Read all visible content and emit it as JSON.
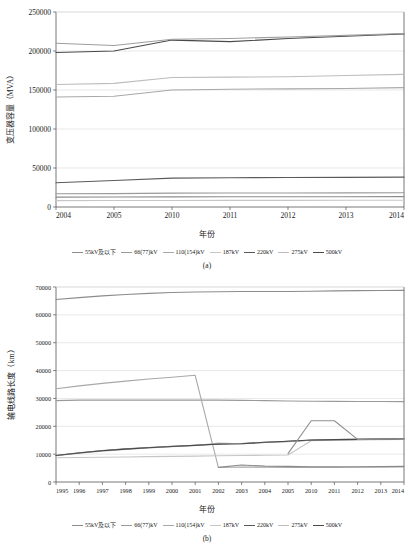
{
  "figure": {
    "panels": [
      {
        "caption": "(a)",
        "xlabel": "年份",
        "ylabel": "变压器容量（MVA）",
        "chart_index": 0
      },
      {
        "caption": "(b)",
        "xlabel": "年份",
        "ylabel": "输电线路长度（km）",
        "chart_index": 1
      }
    ],
    "legend_labels": [
      "55kV及以下",
      "66(77)kV",
      "110(154)kV",
      "187kV",
      "220kV",
      "275kV",
      "500kV"
    ],
    "legend_colors": [
      "#8c8c8c",
      "#9a9a9a",
      "#a8a8a8",
      "#c6c6c6",
      "#5a5a5a",
      "#bdbdbd",
      "#4a4a4a"
    ]
  },
  "chart_data": [
    {
      "type": "line",
      "title": "",
      "subfigure": "(a)",
      "xlabel": "年份",
      "ylabel": "变压器容量（MVA）",
      "categories": [
        "2004",
        "2005",
        "2010",
        "2011",
        "2012",
        "2013",
        "2014"
      ],
      "ylim": [
        0,
        250000
      ],
      "yticks": [
        0,
        50000,
        100000,
        150000,
        200000,
        250000
      ],
      "grid": true,
      "legend_position": "bottom",
      "series": [
        {
          "name": "55kV及以下",
          "color": "#8c8c8c",
          "values": [
            12600,
            12800,
            13000,
            13100,
            13100,
            13200,
            13300
          ]
        },
        {
          "name": "66(77)kV",
          "color": "#9a9a9a",
          "values": [
            17000,
            17200,
            17800,
            17900,
            18000,
            18100,
            18200
          ]
        },
        {
          "name": "110(154)kV",
          "color": "#a8a8a8",
          "values": [
            141000,
            142000,
            150000,
            151000,
            151500,
            152000,
            153000
          ]
        },
        {
          "name": "187kV",
          "color": "#c6c6c6",
          "values": [
            8200,
            8300,
            8400,
            8500,
            8500,
            8600,
            8600
          ]
        },
        {
          "name": "220kV",
          "color": "#5a5a5a",
          "values": [
            31000,
            34000,
            37000,
            37500,
            37800,
            38000,
            38300
          ]
        },
        {
          "name": "275kV",
          "color": "#bdbdbd",
          "values": [
            157000,
            158500,
            166000,
            166500,
            167000,
            168500,
            170000
          ]
        },
        {
          "name": "500kV",
          "color": "#4a4a4a",
          "values": [
            198000,
            200000,
            214000,
            212000,
            216000,
            219000,
            222000
          ]
        },
        {
          "name": "500kV-upper",
          "color": "#9e9e9e",
          "values": [
            210000,
            207000,
            215000,
            216000,
            218000,
            220000,
            222500
          ]
        }
      ]
    },
    {
      "type": "line",
      "title": "",
      "subfigure": "(b)",
      "xlabel": "年份",
      "ylabel": "输电线路长度（km）",
      "categories": [
        "1995",
        "1996",
        "1997",
        "1998",
        "1999",
        "2000",
        "2001",
        "2002",
        "2003",
        "2004",
        "2005",
        "2010",
        "2011",
        "2012",
        "2013",
        "2014"
      ],
      "ylim": [
        0,
        70000
      ],
      "yticks": [
        0,
        10000,
        20000,
        30000,
        40000,
        50000,
        60000,
        70000
      ],
      "grid": true,
      "legend_position": "bottom",
      "series": [
        {
          "name": "55kV及以下",
          "color": "#8c8c8c",
          "values": [
            65500,
            66200,
            66800,
            67300,
            67700,
            68000,
            68200,
            68300,
            68400,
            68400,
            68400,
            68500,
            68600,
            68700,
            68750,
            68800
          ]
        },
        {
          "name": "66(77)kV",
          "color": "#9a9a9a",
          "values": [
            29200,
            29400,
            29400,
            29400,
            29400,
            29400,
            29400,
            29400,
            29300,
            29200,
            29100,
            29000,
            28950,
            28900,
            28880,
            28850
          ]
        },
        {
          "name": "110(154)kV",
          "color": "#a8a8a8",
          "values": [
            33500,
            34500,
            35400,
            36200,
            37000,
            37600,
            38300,
            5200,
            5400,
            5300,
            5250,
            5250,
            5250,
            5300,
            5350,
            5400
          ]
        },
        {
          "name": "187kV",
          "color": "#c6c6c6",
          "values": [
            8700,
            8800,
            8900,
            9000,
            9100,
            9200,
            9300,
            9400,
            9500,
            9600,
            9700,
            14800,
            15000,
            15100,
            15200,
            15300
          ]
        },
        {
          "name": "220kV",
          "color": "#5a5a5a",
          "values": [
            9500,
            10500,
            11300,
            11900,
            12400,
            12800,
            13200,
            13600,
            13800,
            14200,
            14600,
            15000,
            15200,
            15300,
            15400,
            15500
          ]
        },
        {
          "name": "275kV",
          "color": "#bdbdbd",
          "values": [
            9400,
            10300,
            11100,
            11700,
            12200,
            12700,
            13100,
            14000,
            13700,
            14300,
            14500,
            15100,
            15250,
            15150,
            15350,
            15500
          ]
        },
        {
          "name": "500kV",
          "color": "#4a4a4a",
          "values": [
            9500,
            10400,
            11200,
            11800,
            12300,
            12750,
            13150,
            13650,
            13750,
            14250,
            14650,
            15050,
            15200,
            15300,
            15400,
            15500
          ]
        },
        {
          "name": "275kV-peak",
          "color": "#8f8f8f",
          "values": [
            null,
            null,
            null,
            null,
            null,
            null,
            null,
            null,
            null,
            null,
            10200,
            22000,
            22000,
            15300,
            15400,
            15500
          ]
        },
        {
          "name": "187kV-low",
          "color": "#8a8a8a",
          "values": [
            null,
            null,
            null,
            null,
            null,
            null,
            null,
            5250,
            6100,
            5700,
            5600,
            5500,
            5500,
            5500,
            5550,
            5600
          ]
        }
      ]
    }
  ]
}
